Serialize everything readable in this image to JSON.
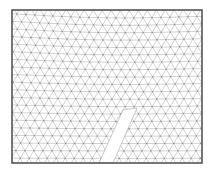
{
  "figure": {
    "type": "triangular-mesh",
    "colors": {
      "background": "#ffffff",
      "frame": "#555555",
      "mesh_line": "#b4b4b4",
      "node": "#8a8a8a",
      "slit_fill": "#ffffff"
    },
    "frame": {
      "x": 12,
      "y": 10,
      "width": 190,
      "height": 153
    },
    "mesh": {
      "row_spacing": 7.6,
      "col_spacing": 9.0,
      "warp_amplitude": 3.5,
      "warp_period": 260
    },
    "slit": {
      "points": [
        [
          123,
          110
        ],
        [
          137,
          108
        ],
        [
          113,
          163
        ],
        [
          99,
          163
        ]
      ]
    }
  }
}
